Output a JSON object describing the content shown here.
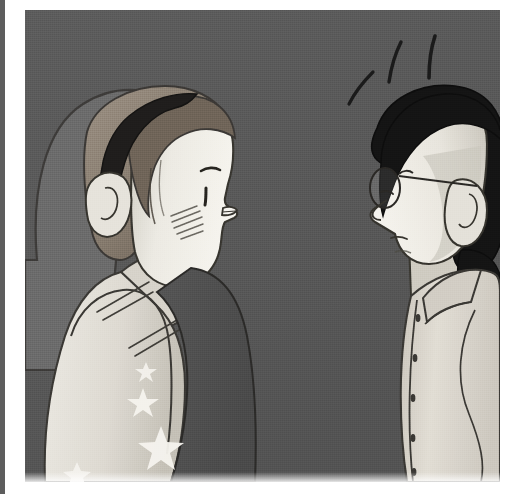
{
  "page": {
    "kind": "comic-panel-illustration",
    "width": 516,
    "height": 500,
    "background_color": "#ffffff",
    "caption_text": "",
    "alt_text": "Grayscale comic panel: two people face each other in profile; the left person blushes while the right person, wearing round glasses, reacts with surprise lines above the head."
  },
  "left_rule": {
    "color": "#5d5d5d",
    "label": "adjacent panel edge"
  },
  "panel": {
    "x": 25,
    "y": 10,
    "width": 475,
    "height": 472,
    "background_color": "#595959",
    "border_color": "#ffffff"
  },
  "palette": {
    "background_gray": "#595959",
    "chair_gray": "#6b6b6b",
    "skin_light": "#f2f0ea",
    "skin_shadow": "#d9d6cd",
    "skin_deep_shadow": "#bdb9af",
    "hair_brown": "#8e8377",
    "hair_brown_dark": "#6f6458",
    "hair_black": "#141414",
    "headband_dark": "#1f1d1c",
    "tank_light": "#e4e2db",
    "tank_shadow": "#c9c6bd",
    "dark_garment": "#4e4e4e",
    "shirt_light": "#ded9d0",
    "shirt_shadow": "#c2bdb3",
    "line_ink": "#2b2a28",
    "star_white": "#f5f3ee",
    "button_dark": "#3a3834"
  },
  "figures": [
    {
      "id": "left-figure",
      "name": "blushing-person",
      "position": "left",
      "facing": "right",
      "hair_color_name": "brown",
      "hair_color": "#8e8377",
      "accessories": [
        "headband"
      ],
      "expression": "blushing",
      "features": {
        "eye": "single small dark eye in profile",
        "blush_hatch_lines": 5,
        "lips": "pursed lips protruding in profile",
        "ear": "visible near ear"
      },
      "clothing": {
        "top": "light sleeveless tank top",
        "top_color": "#e4e2db",
        "lower": "dark star-patterned garment",
        "lower_color": "#4e4e4e",
        "stars": 4,
        "fold_lines": 4
      },
      "behind": {
        "shape": "rounded chair back",
        "color": "#6b6b6b"
      }
    },
    {
      "id": "right-figure",
      "name": "surprised-person-with-glasses",
      "position": "right",
      "facing": "left",
      "hair_color_name": "black",
      "hair_color": "#141414",
      "accessories": [
        "round eyeglasses",
        "ponytail"
      ],
      "expression": "surprised",
      "features": {
        "glasses_shape": "round",
        "glasses_lens_count": 1,
        "temple_arm": "visible going back to the ear",
        "ear": "detailed ear with inner curl",
        "nose": "pointed profile nose"
      },
      "clothing": {
        "top": "collared button-up shirt",
        "top_color": "#ded9d0",
        "collar": "pointed collar",
        "button_count": 5,
        "button_color": "#3a3834"
      },
      "emphasis_lines": {
        "count": 3,
        "meaning": "surprise / shock",
        "color": "#1a1a1a"
      }
    }
  ]
}
